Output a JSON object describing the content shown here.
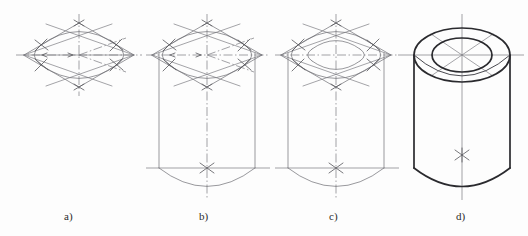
{
  "figure": {
    "caption_style": "lettered-steps",
    "background_color": "#fdfdfd",
    "line_colors": {
      "construction": "#7d7d83",
      "thin_outline": "#6d6d72",
      "medium_outline": "#4a4a50",
      "bold_outline": "#2a2a2e",
      "centerline": "#7a7a80",
      "label_text": "#2b2b2b"
    },
    "steps": [
      {
        "key": "a",
        "label": "a)",
        "label_x": 70,
        "label_y": 219,
        "description": "Isometric rhombus with axes, four-arc approximate ellipse for the top face",
        "center": [
          79,
          55
        ],
        "rhombus_half_width": 55,
        "rhombus_half_height": 32,
        "features": [
          "rhombus",
          "isometric-axes",
          "centerlines",
          "four-center-arcs",
          "radius-marks",
          "tangent-ticks"
        ]
      },
      {
        "key": "b",
        "label": "b)",
        "label_x": 205,
        "label_y": 219,
        "description": "Outer cylinder body projected down from the ellipse, bottom face front arc added",
        "center": [
          207,
          55
        ],
        "rhombus_half_width": 55,
        "rhombus_half_height": 32,
        "body_height": 113,
        "features": [
          "rhombus",
          "four-center-arcs",
          "vertical-generators",
          "bottom-front-arc",
          "bottom-centerline",
          "center-cross"
        ]
      },
      {
        "key": "c",
        "label": "c)",
        "label_x": 335,
        "label_y": 219,
        "description": "Inner bore ellipse constructed concentric with the outer ellipse",
        "center": [
          336,
          55
        ],
        "rhombus_half_width": 55,
        "rhombus_half_height": 32,
        "bore_scale": 0.62,
        "body_height": 113,
        "features": [
          "rhombus",
          "outer-ellipse",
          "inner-ellipse",
          "vertical-generators",
          "bottom-front-arc",
          "center-cross"
        ]
      },
      {
        "key": "d",
        "label": "d)",
        "label_x": 462,
        "label_y": 219,
        "description": "Finished tube: construction lines removed, visible outlines thickened",
        "center": [
          462,
          55
        ],
        "outer_rx": 48,
        "outer_ry": 27,
        "bore_scale": 0.62,
        "body_height": 113,
        "features": [
          "outer-ellipse",
          "inner-ellipse",
          "bore-depth-arc",
          "vertical-silhouette",
          "bottom-front-arc",
          "centerlines",
          "center-cross"
        ]
      }
    ]
  }
}
